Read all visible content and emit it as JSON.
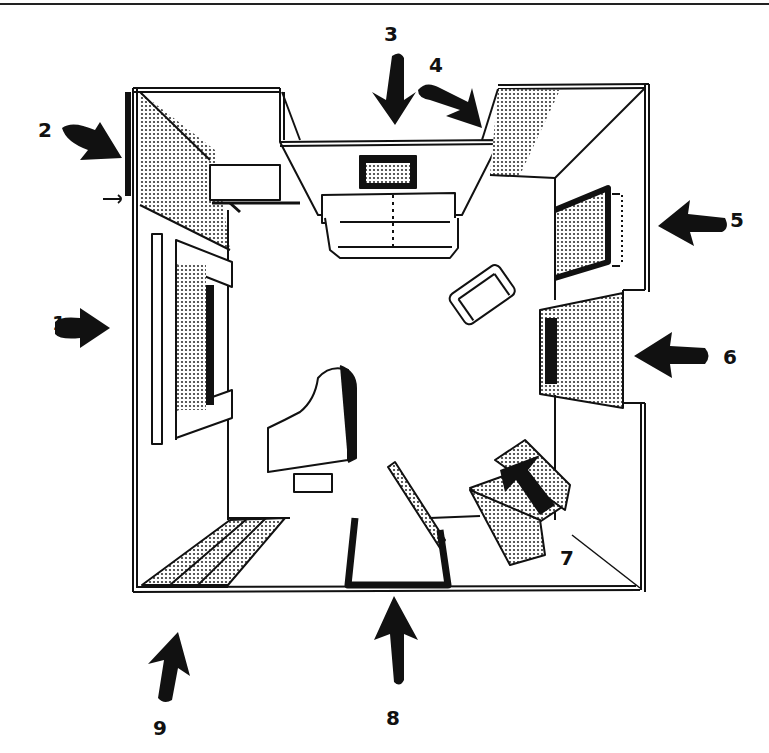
{
  "figure": {
    "ink_color": "#111111",
    "paper_color": "#ffffff",
    "screen_tone": "#9a9a9a"
  },
  "callouts": [
    {
      "number": "1",
      "target": "left wall with window",
      "direction": "right"
    },
    {
      "number": "2",
      "target": "upper-left corner wall",
      "direction": "down-right"
    },
    {
      "number": "3",
      "target": "top wall with sofa and picture",
      "direction": "down"
    },
    {
      "number": "4",
      "target": "upper-right corner wall",
      "direction": "down-right"
    },
    {
      "number": "5",
      "target": "right wall with mirror / cabinet",
      "direction": "left"
    },
    {
      "number": "6",
      "target": "right wall fireplace",
      "direction": "left"
    },
    {
      "number": "7",
      "target": "folding screen",
      "direction": "up-left"
    },
    {
      "number": "8",
      "target": "bottom wall with mirror on stand",
      "direction": "up"
    },
    {
      "number": "9",
      "target": "bottom-left curtain",
      "direction": "up"
    }
  ],
  "furniture": [
    {
      "name": "sofa",
      "location": "top wall"
    },
    {
      "name": "framed picture",
      "location": "top wall, above sofa"
    },
    {
      "name": "window with shutters",
      "location": "left wall"
    },
    {
      "name": "shelf",
      "location": "upper-left"
    },
    {
      "name": "armchair",
      "location": "center right"
    },
    {
      "name": "grand piano with bench",
      "location": "center left"
    },
    {
      "name": "fireplace",
      "location": "right wall"
    },
    {
      "name": "wall mirror",
      "location": "right wall"
    },
    {
      "name": "folding screen",
      "location": "lower right"
    },
    {
      "name": "floor mirror",
      "location": "bottom center"
    },
    {
      "name": "curtain",
      "location": "bottom left"
    }
  ]
}
